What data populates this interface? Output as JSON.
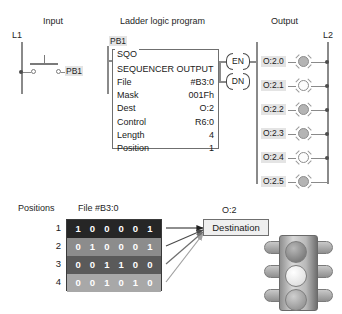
{
  "headers": {
    "input": "Input",
    "program": "Ladder logic program",
    "output": "Output"
  },
  "rails": {
    "left": "L1",
    "right": "L2"
  },
  "input_section": {
    "field_device_label": "PB1",
    "contact_label": "PB1"
  },
  "instruction": {
    "mnemonic": "SQO",
    "title": "SEQUENCER OUTPUT",
    "rows": [
      {
        "key": "File",
        "value": "#B3:0"
      },
      {
        "key": "Mask",
        "value": "001Fh"
      },
      {
        "key": "Dest",
        "value": "O:2"
      },
      {
        "key": "Control",
        "value": "R6:0"
      },
      {
        "key": "Length",
        "value": "4"
      },
      {
        "key": "Position",
        "value": "1"
      }
    ],
    "coils": [
      {
        "label": "EN"
      },
      {
        "label": "DN"
      }
    ]
  },
  "outputs": [
    {
      "address": "O:2.0",
      "state": "on"
    },
    {
      "address": "O:2.1",
      "state": "off"
    },
    {
      "address": "O:2.2",
      "state": "on"
    },
    {
      "address": "O:2.3",
      "state": "on"
    },
    {
      "address": "O:2.4",
      "state": "off"
    },
    {
      "address": "O:2.5",
      "state": "on"
    }
  ],
  "file_table": {
    "positions_label": "Positions",
    "title": "File #B3:0",
    "rows": [
      {
        "position": "1",
        "bits": "1 0 0 0 0 1",
        "fill": "#262626"
      },
      {
        "position": "2",
        "bits": "0 1 0 0 0 1",
        "fill": "#8c8c8c"
      },
      {
        "position": "3",
        "bits": "0 0 1 1 0 0",
        "fill": "#5a5a5a"
      },
      {
        "position": "4",
        "bits": "0 0 1 0 1 0",
        "fill": "#a8a8a8"
      }
    ]
  },
  "destination": {
    "address_label": "O:2",
    "box_label": "Destination"
  },
  "traffic_light": {
    "lamps": [
      {
        "name": "red-lamp",
        "color": "#8f8f8f"
      },
      {
        "name": "amber-lamp",
        "color": "#e8e8e8"
      },
      {
        "name": "green-lamp",
        "color": "#a5a5a5"
      }
    ]
  },
  "colors": {
    "rail": "#8a8a8a",
    "shade": "#e4e4e4",
    "lamp_on": "#b4b4b4",
    "lamp_off": "#fdfdfd"
  }
}
